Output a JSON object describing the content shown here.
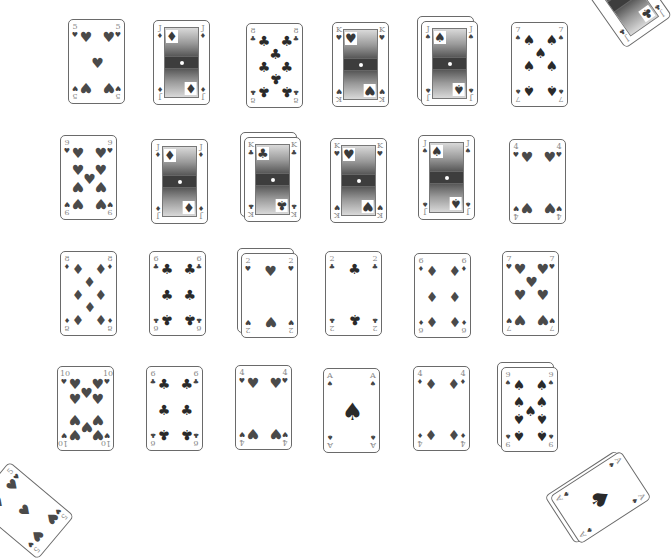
{
  "game": {
    "type": "solitaire-card-layout",
    "grid_rows": 4,
    "grid_cols": 6
  },
  "rows": [
    {
      "cards": [
        {
          "rank": "5",
          "suit": "hearts",
          "symbol": "♥",
          "x": 68,
          "y": 19,
          "stacked": false
        },
        {
          "rank": "J",
          "suit": "diamonds",
          "symbol": "♦",
          "x": 153,
          "y": 20,
          "stacked": false,
          "face": true
        },
        {
          "rank": "8",
          "suit": "clubs",
          "symbol": "♣",
          "x": 246,
          "y": 23,
          "stacked": false
        },
        {
          "rank": "K",
          "suit": "hearts",
          "symbol": "♥",
          "x": 332,
          "y": 22,
          "stacked": false,
          "face": true
        },
        {
          "rank": "J",
          "suit": "spades",
          "symbol": "♠",
          "x": 421,
          "y": 21,
          "stacked": true,
          "face": true
        },
        {
          "rank": "7",
          "suit": "spades",
          "symbol": "♠",
          "x": 511,
          "y": 22,
          "stacked": false
        }
      ]
    },
    {
      "cards": [
        {
          "rank": "9",
          "suit": "hearts",
          "symbol": "♥",
          "x": 60,
          "y": 135,
          "stacked": false
        },
        {
          "rank": "J",
          "suit": "diamonds",
          "symbol": "♦",
          "x": 151,
          "y": 139,
          "stacked": false,
          "face": true
        },
        {
          "rank": "K",
          "suit": "clubs",
          "symbol": "♣",
          "x": 244,
          "y": 137,
          "stacked": true,
          "face": true
        },
        {
          "rank": "K",
          "suit": "hearts",
          "symbol": "♥",
          "x": 330,
          "y": 138,
          "stacked": false,
          "face": true
        },
        {
          "rank": "J",
          "suit": "spades",
          "symbol": "♠",
          "x": 418,
          "y": 135,
          "stacked": false,
          "face": true
        },
        {
          "rank": "4",
          "suit": "hearts",
          "symbol": "♥",
          "x": 509,
          "y": 139,
          "stacked": false
        }
      ]
    },
    {
      "cards": [
        {
          "rank": "8",
          "suit": "diamonds",
          "symbol": "♦",
          "x": 60,
          "y": 251,
          "stacked": false
        },
        {
          "rank": "6",
          "suit": "clubs",
          "symbol": "♣",
          "x": 149,
          "y": 251,
          "stacked": false
        },
        {
          "rank": "2",
          "suit": "hearts",
          "symbol": "♥",
          "x": 241,
          "y": 253,
          "stacked": true
        },
        {
          "rank": "2",
          "suit": "clubs",
          "symbol": "♣",
          "x": 325,
          "y": 251,
          "stacked": false
        },
        {
          "rank": "6",
          "suit": "diamonds",
          "symbol": "♦",
          "x": 414,
          "y": 253,
          "stacked": false
        },
        {
          "rank": "7",
          "suit": "hearts",
          "symbol": "♥",
          "x": 502,
          "y": 251,
          "stacked": false
        }
      ]
    },
    {
      "cards": [
        {
          "rank": "10",
          "suit": "hearts",
          "symbol": "♥",
          "x": 57,
          "y": 366,
          "stacked": false
        },
        {
          "rank": "6",
          "suit": "clubs",
          "symbol": "♣",
          "x": 146,
          "y": 366,
          "stacked": false
        },
        {
          "rank": "4",
          "suit": "hearts",
          "symbol": "♥",
          "x": 235,
          "y": 365,
          "stacked": false
        },
        {
          "rank": "A",
          "suit": "spades",
          "symbol": "♠",
          "x": 323,
          "y": 368,
          "stacked": false
        },
        {
          "rank": "4",
          "suit": "diamonds",
          "symbol": "♦",
          "x": 413,
          "y": 366,
          "stacked": false
        },
        {
          "rank": "9",
          "suit": "spades",
          "symbol": "♠",
          "x": 501,
          "y": 367,
          "stacked": true
        }
      ]
    }
  ],
  "corner_piles": [
    {
      "name": "top-right-pile",
      "rank": "J",
      "suit": "clubs",
      "symbol": "♣",
      "x": 596,
      "y": -45,
      "rotate": -35,
      "face": true
    },
    {
      "name": "bottom-left-pile",
      "rank": "5",
      "suit": "hearts",
      "symbol": "♥",
      "x": -5,
      "y": 468,
      "rotate": -50
    },
    {
      "name": "bottom-right-pile",
      "rank": "A",
      "suit": "spades",
      "symbol": "♠",
      "x": 572,
      "y": 455,
      "rotate": 57,
      "stacked": true
    }
  ]
}
